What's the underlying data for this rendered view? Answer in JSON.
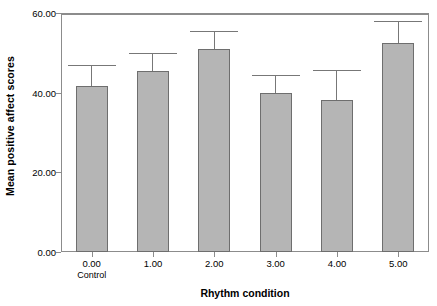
{
  "chart_data": {
    "type": "bar",
    "title": "",
    "xlabel": "Rhythm condition",
    "ylabel": "Mean positive affect scores",
    "categories": [
      "0.00",
      "1.00",
      "2.00",
      "3.00",
      "4.00",
      "5.00"
    ],
    "category_sublabels": [
      "Control",
      "",
      "",
      "",
      "",
      ""
    ],
    "values": [
      41.8,
      45.5,
      51.0,
      40.0,
      38.2,
      52.5
    ],
    "error_upper": [
      46.8,
      49.8,
      55.2,
      44.3,
      45.5,
      57.8
    ],
    "ylim": [
      0,
      60
    ],
    "yticks": [
      0,
      20,
      40,
      60
    ],
    "ytick_labels": [
      "0.00",
      "20.00",
      "40.00",
      "60.00"
    ],
    "grid": false,
    "legend": "none",
    "bar_fill": "#b5b5b5",
    "bar_edge": "#6e6e6e",
    "error_color": "#777777",
    "axis_color": "#8c8c8c",
    "error_bar_type": "upper-only whisker with cap"
  }
}
